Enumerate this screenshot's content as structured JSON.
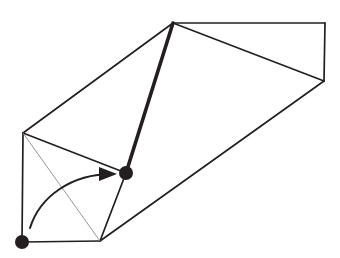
{
  "figure": {
    "canvas": {
      "width": 340,
      "height": 258,
      "background": "#ffffff"
    },
    "colors": {
      "stroke": "#231f20",
      "thin_stroke": "#8a8a8a",
      "marker_fill": "#231f20",
      "background": "#ffffff"
    },
    "stroke_widths": {
      "normal": 1.7,
      "thick": 3.6,
      "thin": 0.9,
      "arrow": 2.0
    },
    "vertices": [
      {
        "name": "apex-top",
        "id": "A",
        "x": 173,
        "y": 23
      },
      {
        "name": "top-right-corner",
        "id": "B",
        "x": 325,
        "y": 23
      },
      {
        "name": "right-corner",
        "id": "C",
        "x": 324,
        "y": 81
      },
      {
        "name": "left-upper-corner",
        "id": "D",
        "x": 23,
        "y": 133
      },
      {
        "name": "center-marked-vertex",
        "id": "E",
        "x": 126,
        "y": 173
      },
      {
        "name": "bottom-mid-vertex",
        "id": "F",
        "x": 100,
        "y": 241
      },
      {
        "name": "bottom-left-marked-vertex",
        "id": "G",
        "x": 22,
        "y": 242
      }
    ],
    "edges": [
      {
        "name": "edge-apex-to-top-right",
        "from": "A",
        "to": "B",
        "weight": "normal"
      },
      {
        "name": "edge-top-right-to-right",
        "from": "B",
        "to": "C",
        "weight": "normal"
      },
      {
        "name": "edge-apex-to-right",
        "from": "A",
        "to": "C",
        "weight": "normal"
      },
      {
        "name": "edge-right-to-bottom-mid",
        "from": "C",
        "to": "F",
        "weight": "normal"
      },
      {
        "name": "edge-apex-to-left-upper",
        "from": "A",
        "to": "D",
        "weight": "normal"
      },
      {
        "name": "edge-apex-to-center",
        "from": "A",
        "to": "E",
        "weight": "thick"
      },
      {
        "name": "edge-left-upper-to-center",
        "from": "D",
        "to": "E",
        "weight": "normal"
      },
      {
        "name": "edge-left-upper-to-bottom-left",
        "from": "D",
        "to": "G",
        "weight": "normal"
      },
      {
        "name": "edge-bottom-left-to-bottom-mid",
        "from": "G",
        "to": "F",
        "weight": "normal"
      },
      {
        "name": "edge-center-to-bottom-mid",
        "from": "E",
        "to": "F",
        "weight": "normal"
      },
      {
        "name": "edge-diagonal-left-face",
        "from": "D",
        "to": "F",
        "weight": "thin"
      }
    ],
    "markers": [
      {
        "name": "vertex-marker-center",
        "x": 126,
        "y": 173,
        "radius": 7
      },
      {
        "name": "vertex-marker-bottom-left",
        "x": 22,
        "y": 242,
        "radius": 7
      }
    ],
    "arrow": {
      "name": "fold-direction-arrow",
      "path": "M 30 228 C 40 196, 72 174, 112 174",
      "head": "M 99 167 L 117 174 L 99 181 Z",
      "start": {
        "x": 30,
        "y": 228
      },
      "end": {
        "x": 117,
        "y": 174
      },
      "label": ""
    }
  }
}
